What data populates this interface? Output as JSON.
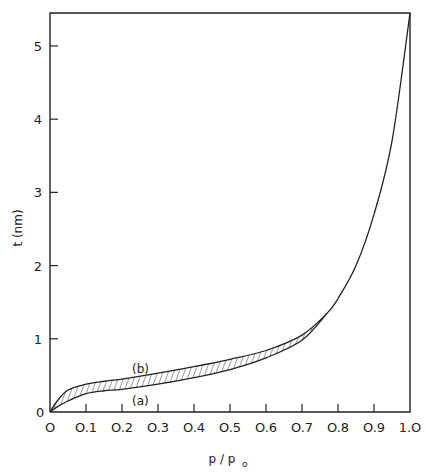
{
  "chart_data": {
    "type": "line",
    "title": "",
    "xlabel": "p / p₀",
    "ylabel": "t (nm)",
    "xlim": [
      0,
      1.0
    ],
    "ylim": [
      0,
      5.45
    ],
    "grid": false,
    "legend": "none (inline curve labels)",
    "x_ticks": [
      "0",
      "0.1",
      "0.2",
      "0.3",
      "0.4",
      "0.5",
      "0.6",
      "0.7",
      "0.8",
      "0.9",
      "1.0"
    ],
    "y_ticks": [
      "0",
      "1",
      "2",
      "3",
      "4",
      "5"
    ],
    "series": [
      {
        "name": "(b)",
        "x": [
          0,
          0.02,
          0.05,
          0.1,
          0.15,
          0.2,
          0.3,
          0.4,
          0.5,
          0.6,
          0.7,
          0.77,
          0.8,
          0.85,
          0.9,
          0.95,
          1.0
        ],
        "values": [
          0,
          0.15,
          0.3,
          0.38,
          0.42,
          0.45,
          0.53,
          0.62,
          0.72,
          0.84,
          1.05,
          1.35,
          1.55,
          2.0,
          2.7,
          3.7,
          5.45
        ]
      },
      {
        "name": "(a)",
        "x": [
          0,
          0.02,
          0.05,
          0.1,
          0.15,
          0.2,
          0.3,
          0.4,
          0.5,
          0.6,
          0.7,
          0.77
        ],
        "values": [
          0,
          0.07,
          0.15,
          0.25,
          0.29,
          0.31,
          0.38,
          0.47,
          0.58,
          0.74,
          0.98,
          1.35
        ]
      }
    ],
    "annotations": [
      {
        "text": "(b)",
        "x": 0.23,
        "y": 0.62
      },
      {
        "text": "(a)",
        "x": 0.23,
        "y": 0.18
      },
      {
        "text": "hatched region between curves (a) and (b)",
        "x_range": [
          0,
          0.77
        ]
      }
    ]
  },
  "labels": {
    "xlabel": "p / p",
    "xlabel_sub": "o",
    "ylabel": "t (nm)",
    "curve_a": "(a)",
    "curve_b": "(b)",
    "origin_y": "0"
  }
}
